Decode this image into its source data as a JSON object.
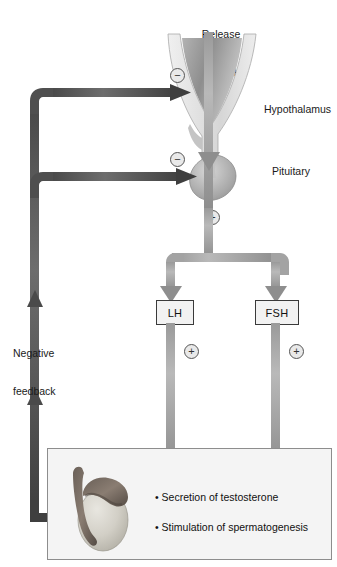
{
  "diagram": {
    "colors": {
      "stimulatory_arrow": "#9a9a9a",
      "inhibitory_arrow": "#4a4a4a",
      "panel_background": "#f4f4f4",
      "panel_border": "#8d8d8d",
      "box_fill": "#f2f2f2",
      "box_border": "#3a3a3a"
    }
  },
  "labels": {
    "release_line1": "Release",
    "release_line2": "of GnRH",
    "hypothalamus": "Hypothalamus",
    "pituitary": "Pituitary",
    "negative_line1": "Negative",
    "negative_line2": "feedback"
  },
  "hormone_boxes": [
    {
      "id": "lh",
      "label": "LH"
    },
    {
      "id": "fsh",
      "label": "FSH"
    }
  ],
  "signs": {
    "minus": "−",
    "plus": "+"
  },
  "sign_markers": [
    {
      "id": "minus-hypothalamus",
      "symbol": "−",
      "meaning": "negative feedback to hypothalamus"
    },
    {
      "id": "minus-pituitary",
      "symbol": "−",
      "meaning": "negative feedback to pituitary"
    },
    {
      "id": "plus-pituitary",
      "symbol": "+",
      "meaning": "GnRH stimulates pituitary"
    },
    {
      "id": "plus-lh",
      "symbol": "+",
      "meaning": "LH stimulates testis"
    },
    {
      "id": "plus-fsh",
      "symbol": "+",
      "meaning": "FSH stimulates testis"
    }
  ],
  "target_effects": [
    {
      "bullet": "•",
      "text": "Secretion of testosterone"
    },
    {
      "bullet": "•",
      "text": "Stimulation of spermatogenesis"
    }
  ]
}
